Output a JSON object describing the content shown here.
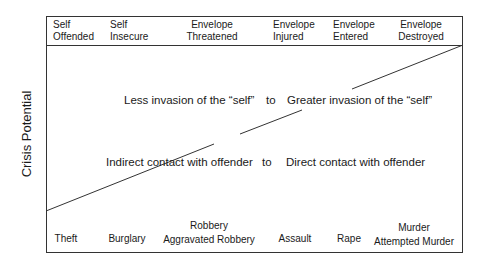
{
  "y_axis_label": "Crisis Potential",
  "header_columns": [
    {
      "line1": "Self",
      "line2": "Offended"
    },
    {
      "line1": "Self",
      "line2": "Insecure"
    },
    {
      "line1": "Envelope",
      "line2": "Threatened"
    },
    {
      "line1": "Envelope",
      "line2": "Injured"
    },
    {
      "line1": "Envelope",
      "line2": "Entered"
    },
    {
      "line1": "Envelope",
      "line2": "Destroyed"
    }
  ],
  "continuum_1": {
    "left": "Less invasion of the “self”",
    "connector": "to",
    "right": "Greater invasion of the “self”"
  },
  "continuum_2": {
    "left": "Indirect contact with offender",
    "connector": "to",
    "right": "Direct contact with offender"
  },
  "crimes": [
    {
      "line1": "Theft",
      "line2": ""
    },
    {
      "line1": "Burglary",
      "line2": ""
    },
    {
      "line1": "Robbery",
      "line2": "Aggravated Robbery"
    },
    {
      "line1": "Assault",
      "line2": ""
    },
    {
      "line1": "Rape",
      "line2": ""
    },
    {
      "line1": "Murder",
      "line2": "Attempted Murder"
    }
  ],
  "diagonal": {
    "x1": 46,
    "y1": 211,
    "x2": 463,
    "y2": 45
  }
}
